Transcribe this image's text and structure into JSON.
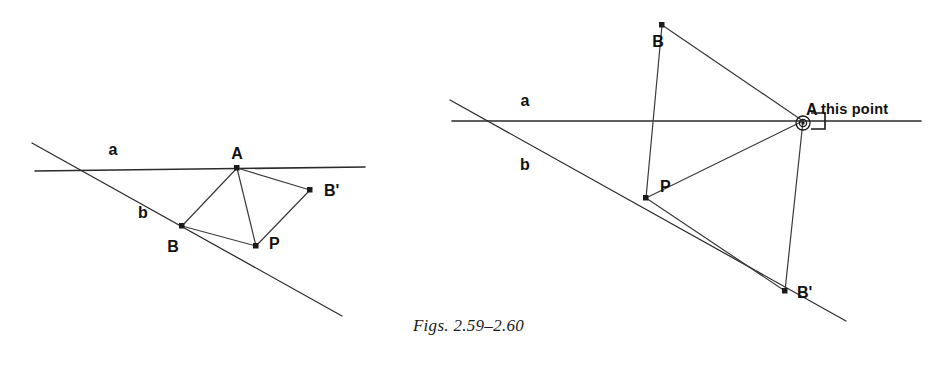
{
  "figure": {
    "caption": "Figs. 2.59–2.60",
    "background_color": "#ffffff",
    "ink_color": "#2b2b2b",
    "type": "geometry-construction-diagram"
  },
  "left_figure": {
    "name": "Fig. 2.59",
    "labels": {
      "line_a": "a",
      "line_b": "b",
      "point_A": "A",
      "point_B": "B",
      "point_P": "P",
      "point_B_prime": "B'"
    },
    "points": {
      "A": {
        "x": 237,
        "y": 168
      },
      "B": {
        "x": 182,
        "y": 226
      },
      "P": {
        "x": 256,
        "y": 246
      },
      "B_prime": {
        "x": 310,
        "y": 190
      },
      "intersection": {
        "x": 82,
        "y": 170
      }
    },
    "label_positions": {
      "line_a": {
        "x": 113,
        "y": 155
      },
      "line_b": {
        "x": 143,
        "y": 218
      },
      "point_A": {
        "x": 237,
        "y": 159
      },
      "point_B": {
        "x": 173,
        "y": 252
      },
      "point_P": {
        "x": 269,
        "y": 249
      },
      "point_B_prime": {
        "x": 324,
        "y": 196
      }
    },
    "line_a_span": {
      "x1": 35,
      "y1": 171,
      "x2": 365,
      "y2": 167
    },
    "line_b_span": {
      "x1": 32,
      "y1": 143,
      "x2": 342,
      "y2": 316
    },
    "segments": [
      {
        "name": "A-B",
        "from": "A",
        "to": "B"
      },
      {
        "name": "A-P",
        "from": "A",
        "to": "P"
      },
      {
        "name": "A-B-prime",
        "from": "A",
        "to": "B_prime"
      },
      {
        "name": "B-P",
        "from": "B",
        "to": "P"
      },
      {
        "name": "P-B-prime",
        "from": "P",
        "to": "B_prime"
      }
    ]
  },
  "right_figure": {
    "name": "Fig. 2.60",
    "labels": {
      "line_a": "a",
      "line_b": "b",
      "point_A": "A",
      "point_B": "B",
      "point_P": "P",
      "point_B_prime": "B'",
      "annotation": "this point"
    },
    "points": {
      "A": {
        "x": 803,
        "y": 121
      },
      "B": {
        "x": 662,
        "y": 25
      },
      "P": {
        "x": 646,
        "y": 198
      },
      "B_prime": {
        "x": 785,
        "y": 291
      },
      "intersection": {
        "x": 483,
        "y": 121
      }
    },
    "label_positions": {
      "line_a": {
        "x": 525,
        "y": 106
      },
      "line_b": {
        "x": 525,
        "y": 170
      },
      "point_A": {
        "x": 810,
        "y": 116
      },
      "point_B": {
        "x": 658,
        "y": 46
      },
      "point_P": {
        "x": 661,
        "y": 190
      },
      "point_B_prime": {
        "x": 798,
        "y": 297
      },
      "annotation": {
        "x": 824,
        "y": 114
      }
    },
    "line_a_span": {
      "x1": 452,
      "y1": 121,
      "x2": 921,
      "y2": 121
    },
    "line_b_span": {
      "x1": 450,
      "y1": 100,
      "x2": 846,
      "y2": 321
    },
    "segments": [
      {
        "name": "B-A",
        "from": "B",
        "to": "A"
      },
      {
        "name": "B-P",
        "from": "B",
        "to": "P"
      },
      {
        "name": "P-A",
        "from": "P",
        "to": "A"
      },
      {
        "name": "P-B-prime",
        "from": "P",
        "to": "B_prime"
      },
      {
        "name": "A-B-prime",
        "from": "A",
        "to": "B_prime"
      }
    ],
    "marker": {
      "ring_radius_outer": 7,
      "ring_radius_inner": 4,
      "right_angle_size": 16
    }
  }
}
